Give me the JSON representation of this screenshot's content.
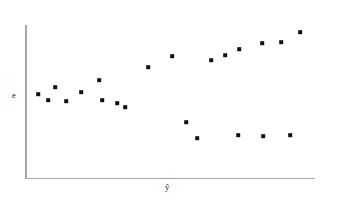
{
  "figure": {
    "background_color": "#ffffff",
    "axis_color": "#a6a6a6",
    "marker_color": "#111111"
  },
  "labels": {
    "y_axis": "e",
    "x_axis": "ŷ"
  },
  "chart_data": {
    "type": "scatter",
    "title": "",
    "xlabel": "ŷ",
    "ylabel": "e",
    "grid": false,
    "legend": null,
    "axis_pixel_frame": {
      "x_origin": 25,
      "y_origin": 178,
      "x_end": 315,
      "y_top": 25
    },
    "xlim": [
      0,
      1
    ],
    "ylim": [
      -1,
      1
    ],
    "series": [
      {
        "name": "residuals",
        "marker": "square",
        "points": [
          {
            "px": 38,
            "py": 94
          },
          {
            "px": 48,
            "py": 100
          },
          {
            "px": 55,
            "py": 87
          },
          {
            "px": 66,
            "py": 101
          },
          {
            "px": 81,
            "py": 92
          },
          {
            "px": 99,
            "py": 80
          },
          {
            "px": 102,
            "py": 100
          },
          {
            "px": 117,
            "py": 103
          },
          {
            "px": 125,
            "py": 107
          },
          {
            "px": 148,
            "py": 67
          },
          {
            "px": 172,
            "py": 56
          },
          {
            "px": 186,
            "py": 122
          },
          {
            "px": 197,
            "py": 138
          },
          {
            "px": 211,
            "py": 60
          },
          {
            "px": 225,
            "py": 55
          },
          {
            "px": 239,
            "py": 49
          },
          {
            "px": 238,
            "py": 135
          },
          {
            "px": 262,
            "py": 43
          },
          {
            "px": 263,
            "py": 136
          },
          {
            "px": 281,
            "py": 42
          },
          {
            "px": 290,
            "py": 135
          },
          {
            "px": 300,
            "py": 32
          }
        ]
      }
    ]
  }
}
